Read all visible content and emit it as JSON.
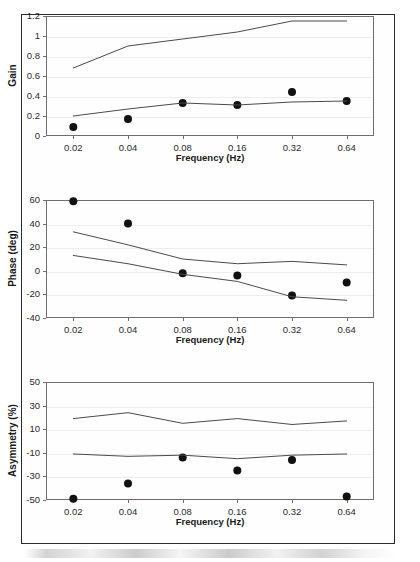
{
  "figure": {
    "panel_count": 3,
    "marker_color": "#111111",
    "line_color": "#4a4a4a",
    "frame_color": "#2b2b2b"
  },
  "chart_data": [
    {
      "id": "gain",
      "type": "scatter",
      "title": "",
      "xlabel": "Frequency (Hz)",
      "ylabel": "Gain",
      "x": [
        0.02,
        0.04,
        0.08,
        0.16,
        0.32,
        0.64
      ],
      "categories": [
        "0.02",
        "0.04",
        "0.08",
        "0.16",
        "0.32",
        "0.64"
      ],
      "xscale": "category",
      "ylim": [
        0,
        1.2
      ],
      "yticks": [
        0,
        0.2,
        0.4,
        0.6,
        0.8,
        1,
        1.2
      ],
      "ytick_labels": [
        "0",
        "0.2",
        "0.4",
        "0.6",
        "0.8",
        "1",
        "1.2"
      ],
      "grid": true,
      "legend": "none",
      "series": [
        {
          "name": "data",
          "kind": "markers",
          "values": [
            0.09,
            0.17,
            0.33,
            0.31,
            0.44,
            0.35
          ]
        },
        {
          "name": "upper-bound",
          "kind": "line",
          "values": [
            0.68,
            0.9,
            0.97,
            1.04,
            1.15,
            1.15
          ]
        },
        {
          "name": "lower-bound",
          "kind": "line",
          "values": [
            0.2,
            0.27,
            0.33,
            0.31,
            0.34,
            0.35
          ]
        }
      ]
    },
    {
      "id": "phase",
      "type": "scatter",
      "title": "",
      "xlabel": "Frequency (Hz)",
      "ylabel": "Phase (deg)",
      "x": [
        0.02,
        0.04,
        0.08,
        0.16,
        0.32,
        0.64
      ],
      "categories": [
        "0.02",
        "0.04",
        "0.08",
        "0.16",
        "0.32",
        "0.64"
      ],
      "xscale": "category",
      "ylim": [
        -40,
        60
      ],
      "yticks": [
        -40,
        -20,
        0,
        20,
        40,
        60
      ],
      "ytick_labels": [
        "-40",
        "-20",
        "0",
        "20",
        "40",
        "60"
      ],
      "grid": true,
      "legend": "none",
      "series": [
        {
          "name": "data",
          "kind": "markers",
          "values": [
            59,
            40,
            -2,
            -4,
            -21,
            -10
          ]
        },
        {
          "name": "upper-bound",
          "kind": "line",
          "values": [
            33,
            22,
            10,
            6,
            8,
            5
          ]
        },
        {
          "name": "lower-bound",
          "kind": "line",
          "values": [
            13,
            6,
            -3,
            -9,
            -22,
            -25
          ]
        }
      ]
    },
    {
      "id": "asymmetry",
      "type": "scatter",
      "title": "",
      "xlabel": "Frequency (Hz)",
      "ylabel": "Asymmetry (%)",
      "x": [
        0.02,
        0.04,
        0.08,
        0.16,
        0.32,
        0.64
      ],
      "categories": [
        "0.02",
        "0.04",
        "0.08",
        "0.16",
        "0.32",
        "0.64"
      ],
      "xscale": "category",
      "ylim": [
        -50,
        50
      ],
      "yticks": [
        -50,
        -30,
        -10,
        10,
        30,
        50
      ],
      "ytick_labels": [
        "-50",
        "-30",
        "-10",
        "10",
        "30",
        "50"
      ],
      "grid": true,
      "legend": "none",
      "series": [
        {
          "name": "data",
          "kind": "markers",
          "values": [
            -49,
            -36,
            -14,
            -25,
            -16,
            -47
          ]
        },
        {
          "name": "upper-bound",
          "kind": "line",
          "values": [
            19,
            24,
            15,
            19,
            14,
            17
          ]
        },
        {
          "name": "lower-bound",
          "kind": "line",
          "values": [
            -11,
            -13,
            -12,
            -15,
            -12,
            -11
          ]
        }
      ]
    }
  ]
}
